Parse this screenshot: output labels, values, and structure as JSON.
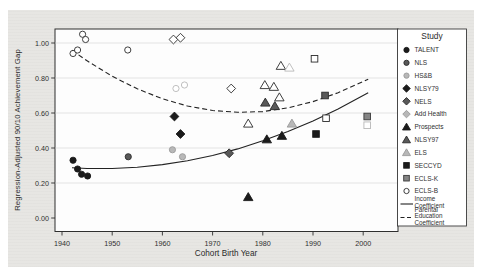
{
  "figure": {
    "legend_title": "Study",
    "x_axis_title": "Cohort Birth Year",
    "y_axis_title": "Regression-Adjusted 90/10 Achievement Gap"
  },
  "chart_data": {
    "type": "scatter",
    "title": "",
    "xlabel": "Cohort Birth Year",
    "ylabel": "Regression-Adjusted 90/10 Achievement Gap",
    "xlim": [
      1938.5,
      2007
    ],
    "ylim": [
      -0.07,
      1.09
    ],
    "grid": true,
    "legend_position": "right",
    "legend_title": "Study",
    "xticks": [
      1940,
      1950,
      1960,
      1970,
      1980,
      1990,
      2000
    ],
    "xtick_labels": [
      "1940",
      "1950",
      "1960",
      "1970",
      "1980",
      "1990",
      "2000"
    ],
    "yticks": [
      0,
      0.2,
      0.4,
      0.6,
      0.8,
      1.0
    ],
    "ytick_labels": [
      "0.00",
      "0.20",
      "0.40",
      "0.60",
      "0.80",
      "1.00"
    ],
    "colors": {
      "black": "#1b1b1b",
      "darkgray": "#595959",
      "gray": "#858585",
      "lightgray": "#b8b8b8",
      "white": "#ffffff",
      "line": "#222222",
      "grid": "#dcdcdc",
      "panel": "#fdfdfd",
      "figure_bg": "#e7e6e3",
      "text": "#2f2f2f"
    },
    "studies": [
      {
        "label": "TALENT",
        "shape": "circle",
        "fill": "black"
      },
      {
        "label": "NLS",
        "shape": "circle",
        "fill": "darkgray"
      },
      {
        "label": "HS&B",
        "shape": "circle",
        "fill": "lightgray"
      },
      {
        "label": "NLSY79",
        "shape": "diamond",
        "fill": "black"
      },
      {
        "label": "NELS",
        "shape": "diamond",
        "fill": "darkgray"
      },
      {
        "label": "Add Health",
        "shape": "diamond",
        "fill": "lightgray"
      },
      {
        "label": "Prospects",
        "shape": "triangle",
        "fill": "black"
      },
      {
        "label": "NLSY97",
        "shape": "triangle",
        "fill": "darkgray"
      },
      {
        "label": "ELS",
        "shape": "triangle",
        "fill": "lightgray"
      },
      {
        "label": "SECCYD",
        "shape": "square",
        "fill": "black"
      },
      {
        "label": "ECLS-K",
        "shape": "square",
        "fill": "gray"
      },
      {
        "label": "ECLS-B",
        "shape": "circle",
        "fill": "open"
      }
    ],
    "line_series": [
      {
        "name": "Income Coefficient",
        "label_lines": [
          "Income",
          "Coefficient"
        ],
        "style": "solid",
        "x": [
          1942,
          1945,
          1950,
          1955,
          1960,
          1965,
          1970,
          1975,
          1980,
          1985,
          1990,
          1995,
          2001
        ],
        "y": [
          0.287,
          0.283,
          0.283,
          0.29,
          0.305,
          0.327,
          0.357,
          0.395,
          0.441,
          0.494,
          0.555,
          0.623,
          0.716
        ]
      },
      {
        "name": "Parental Education Coefficient",
        "label_lines": [
          "Parental",
          "Education",
          "Coefficient"
        ],
        "style": "dashed",
        "x": [
          1942,
          1945,
          1950,
          1955,
          1960,
          1965,
          1970,
          1975,
          1980,
          1985,
          1990,
          1995,
          2001
        ],
        "y": [
          0.958,
          0.898,
          0.81,
          0.738,
          0.681,
          0.64,
          0.614,
          0.604,
          0.608,
          0.629,
          0.665,
          0.716,
          0.793
        ]
      }
    ],
    "points": [
      {
        "study": "TALENT",
        "kind": "income",
        "shape": "circle",
        "fill": "black",
        "x": 1942.2,
        "y": 0.33
      },
      {
        "study": "TALENT",
        "kind": "income",
        "shape": "circle",
        "fill": "black",
        "x": 1943.1,
        "y": 0.28
      },
      {
        "study": "TALENT",
        "kind": "income",
        "shape": "circle",
        "fill": "black",
        "x": 1943.9,
        "y": 0.25
      },
      {
        "study": "TALENT",
        "kind": "income",
        "shape": "circle",
        "fill": "black",
        "x": 1945.1,
        "y": 0.24
      },
      {
        "study": "NLS",
        "kind": "income",
        "shape": "circle",
        "fill": "darkgray",
        "x": 1953.2,
        "y": 0.35
      },
      {
        "study": "HS&B",
        "kind": "income",
        "shape": "circle",
        "fill": "lightgray",
        "x": 1962.0,
        "y": 0.39
      },
      {
        "study": "HS&B",
        "kind": "income",
        "shape": "circle",
        "fill": "lightgray",
        "x": 1964.0,
        "y": 0.35
      },
      {
        "study": "NLSY79",
        "kind": "income",
        "shape": "diamond",
        "fill": "black",
        "x": 1962.4,
        "y": 0.58
      },
      {
        "study": "NLSY79",
        "kind": "income",
        "shape": "diamond",
        "fill": "black",
        "x": 1963.6,
        "y": 0.48
      },
      {
        "study": "NELS",
        "kind": "income",
        "shape": "diamond",
        "fill": "darkgray",
        "x": 1973.3,
        "y": 0.37
      },
      {
        "study": "Prospects",
        "kind": "income",
        "shape": "triangle",
        "fill": "black",
        "x": 1977.1,
        "y": 0.12
      },
      {
        "study": "Prospects",
        "kind": "income",
        "shape": "triangle",
        "fill": "black",
        "x": 1980.8,
        "y": 0.45
      },
      {
        "study": "Prospects",
        "kind": "income",
        "shape": "triangle",
        "fill": "black",
        "x": 1983.8,
        "y": 0.47
      },
      {
        "study": "NLSY97",
        "kind": "income",
        "shape": "triangle",
        "fill": "darkgray",
        "x": 1980.5,
        "y": 0.66
      },
      {
        "study": "NLSY97",
        "kind": "income",
        "shape": "triangle",
        "fill": "darkgray",
        "x": 1982.4,
        "y": 0.64
      },
      {
        "study": "ELS",
        "kind": "income",
        "shape": "triangle",
        "fill": "lightgray",
        "x": 1985.8,
        "y": 0.54
      },
      {
        "study": "SECCYD",
        "kind": "income",
        "shape": "square",
        "fill": "black",
        "x": 1990.6,
        "y": 0.48
      },
      {
        "study": "ECLS-K",
        "kind": "income",
        "shape": "square",
        "fill": "darkgray",
        "x": 1992.4,
        "y": 0.7
      },
      {
        "study": "ECLS-B",
        "kind": "income",
        "shape": "square",
        "fill": "gray",
        "x": 2000.8,
        "y": 0.58
      },
      {
        "study": "TALENT",
        "kind": "parental-education",
        "shape": "circle",
        "fill": "open",
        "x": 1942.2,
        "y": 0.94
      },
      {
        "study": "TALENT",
        "kind": "parental-education",
        "shape": "circle",
        "fill": "open",
        "x": 1943.1,
        "y": 0.96
      },
      {
        "study": "TALENT",
        "kind": "parental-education",
        "shape": "circle",
        "fill": "open",
        "x": 1944.1,
        "y": 1.05
      },
      {
        "study": "TALENT",
        "kind": "parental-education",
        "shape": "circle",
        "fill": "open",
        "x": 1944.7,
        "y": 1.02
      },
      {
        "study": "NLS",
        "kind": "parental-education",
        "shape": "circle",
        "fill": "open",
        "x": 1953.1,
        "y": 0.96
      },
      {
        "study": "HS&B",
        "kind": "parental-education",
        "shape": "circle",
        "fill": "open-light",
        "x": 1962.7,
        "y": 0.74
      },
      {
        "study": "HS&B",
        "kind": "parental-education",
        "shape": "circle",
        "fill": "open-light",
        "x": 1964.4,
        "y": 0.76
      },
      {
        "study": "NLSY79",
        "kind": "parental-education",
        "shape": "diamond",
        "fill": "open",
        "x": 1962.2,
        "y": 1.02
      },
      {
        "study": "NLSY79",
        "kind": "parental-education",
        "shape": "diamond",
        "fill": "open",
        "x": 1963.6,
        "y": 1.03
      },
      {
        "study": "NELS",
        "kind": "parental-education",
        "shape": "diamond",
        "fill": "open",
        "x": 1973.7,
        "y": 0.74
      },
      {
        "study": "Prospects",
        "kind": "parental-education",
        "shape": "triangle",
        "fill": "open",
        "x": 1977.1,
        "y": 0.54
      },
      {
        "study": "NLSY97",
        "kind": "parental-education",
        "shape": "triangle",
        "fill": "open",
        "x": 1980.4,
        "y": 0.76
      },
      {
        "study": "NLSY97",
        "kind": "parental-education",
        "shape": "triangle",
        "fill": "open",
        "x": 1982.2,
        "y": 0.75
      },
      {
        "study": "NLSY97",
        "kind": "parental-education",
        "shape": "triangle",
        "fill": "open",
        "x": 1983.3,
        "y": 0.69
      },
      {
        "study": "ELS",
        "kind": "parental-education",
        "shape": "triangle",
        "fill": "open",
        "x": 1983.6,
        "y": 0.87
      },
      {
        "study": "ELS",
        "kind": "parental-education",
        "shape": "triangle",
        "fill": "open-light",
        "x": 1985.3,
        "y": 0.86
      },
      {
        "study": "SECCYD",
        "kind": "parental-education",
        "shape": "square",
        "fill": "open",
        "x": 1990.3,
        "y": 0.91
      },
      {
        "study": "ECLS-K",
        "kind": "parental-education",
        "shape": "square",
        "fill": "open",
        "x": 1992.6,
        "y": 0.57
      },
      {
        "study": "ECLS-B",
        "kind": "parental-education",
        "shape": "square",
        "fill": "open-light",
        "x": 2000.8,
        "y": 0.53
      }
    ]
  }
}
